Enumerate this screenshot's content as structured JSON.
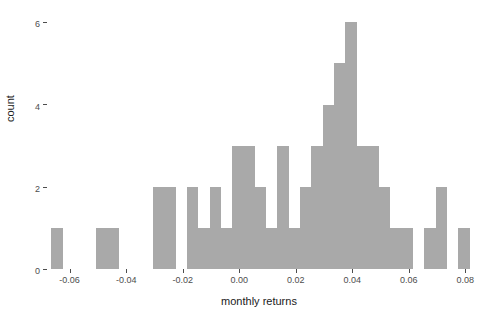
{
  "chart_data": {
    "type": "bar",
    "chart_subtype": "histogram",
    "title": "",
    "subtitle": "",
    "xlabel": "monthly returns",
    "ylabel": "count",
    "xlim": [
      -0.068,
      0.082
    ],
    "ylim": [
      0,
      6.3
    ],
    "bin_width": 0.004,
    "grid": false,
    "legend": null,
    "annotations": [],
    "bar_color": "#a9a9a9",
    "xticks": [
      -0.06,
      -0.04,
      -0.02,
      0.0,
      0.02,
      0.04,
      0.06,
      0.08
    ],
    "xtick_labels": [
      "-0.06",
      "-0.04",
      "-0.02",
      "0.00",
      "0.02",
      "0.04",
      "0.06",
      "0.08"
    ],
    "yticks": [
      0,
      2,
      4,
      6
    ],
    "ytick_labels": [
      "0",
      "2",
      "4",
      "6"
    ],
    "bins": [
      {
        "x0": -0.0665,
        "x1": -0.0625,
        "count": 1
      },
      {
        "x0": -0.0505,
        "x1": -0.0465,
        "count": 1
      },
      {
        "x0": -0.0465,
        "x1": -0.0425,
        "count": 1
      },
      {
        "x0": -0.0305,
        "x1": -0.0265,
        "count": 2
      },
      {
        "x0": -0.0265,
        "x1": -0.0225,
        "count": 2
      },
      {
        "x0": -0.0185,
        "x1": -0.0145,
        "count": 2
      },
      {
        "x0": -0.0145,
        "x1": -0.0105,
        "count": 1
      },
      {
        "x0": -0.0105,
        "x1": -0.0065,
        "count": 2
      },
      {
        "x0": -0.0065,
        "x1": -0.0025,
        "count": 1
      },
      {
        "x0": -0.0025,
        "x1": 0.0015,
        "count": 3
      },
      {
        "x0": 0.0015,
        "x1": 0.0055,
        "count": 3
      },
      {
        "x0": 0.0055,
        "x1": 0.0095,
        "count": 2
      },
      {
        "x0": 0.0095,
        "x1": 0.0135,
        "count": 1
      },
      {
        "x0": 0.0135,
        "x1": 0.0175,
        "count": 3
      },
      {
        "x0": 0.0175,
        "x1": 0.0215,
        "count": 1
      },
      {
        "x0": 0.0215,
        "x1": 0.0255,
        "count": 2
      },
      {
        "x0": 0.0255,
        "x1": 0.0295,
        "count": 3
      },
      {
        "x0": 0.0295,
        "x1": 0.0335,
        "count": 4
      },
      {
        "x0": 0.0335,
        "x1": 0.0375,
        "count": 5
      },
      {
        "x0": 0.0375,
        "x1": 0.0415,
        "count": 6
      },
      {
        "x0": 0.0415,
        "x1": 0.0455,
        "count": 3
      },
      {
        "x0": 0.0455,
        "x1": 0.0495,
        "count": 3
      },
      {
        "x0": 0.0495,
        "x1": 0.0535,
        "count": 2
      },
      {
        "x0": 0.0535,
        "x1": 0.0575,
        "count": 1
      },
      {
        "x0": 0.0575,
        "x1": 0.0615,
        "count": 1
      },
      {
        "x0": 0.0655,
        "x1": 0.0695,
        "count": 1
      },
      {
        "x0": 0.0695,
        "x1": 0.0735,
        "count": 2
      },
      {
        "x0": 0.0775,
        "x1": 0.0815,
        "count": 1
      },
      {
        "x0": 0.0895,
        "x1": 0.0935,
        "count": 1
      },
      {
        "x0": 0.0975,
        "x1": 0.1015,
        "count": 1
      },
      {
        "x0": 0.1095,
        "x1": 0.1135,
        "count": 1
      }
    ],
    "_bin_note": "x0/x1 are normalized positions within the rendered axis; see bins_axis for true data coordinates",
    "bins_axis": [
      {
        "center": -0.0645,
        "count": 1
      },
      {
        "center": -0.0485,
        "count": 1
      },
      {
        "center": -0.0445,
        "count": 1
      },
      {
        "center": -0.0285,
        "count": 2
      },
      {
        "center": -0.0245,
        "count": 2
      },
      {
        "center": -0.0165,
        "count": 2
      },
      {
        "center": -0.0125,
        "count": 1
      },
      {
        "center": -0.0085,
        "count": 2
      },
      {
        "center": -0.0045,
        "count": 1
      },
      {
        "center": -0.0005,
        "count": 3
      },
      {
        "center": 0.0035,
        "count": 3
      },
      {
        "center": 0.0075,
        "count": 2
      },
      {
        "center": 0.0115,
        "count": 1
      },
      {
        "center": 0.0155,
        "count": 3
      },
      {
        "center": 0.0195,
        "count": 1
      },
      {
        "center": 0.0235,
        "count": 2
      },
      {
        "center": 0.0275,
        "count": 3
      },
      {
        "center": 0.0315,
        "count": 4
      },
      {
        "center": 0.0355,
        "count": 5
      },
      {
        "center": 0.0395,
        "count": 6
      },
      {
        "center": 0.0435,
        "count": 3
      },
      {
        "center": 0.0475,
        "count": 3
      },
      {
        "center": 0.0515,
        "count": 2
      },
      {
        "center": 0.0555,
        "count": 1
      },
      {
        "center": 0.0595,
        "count": 1
      },
      {
        "center": 0.0675,
        "count": 1
      },
      {
        "center": 0.0715,
        "count": 2
      },
      {
        "center": 0.0795,
        "count": 1
      }
    ],
    "total_count": 59
  }
}
